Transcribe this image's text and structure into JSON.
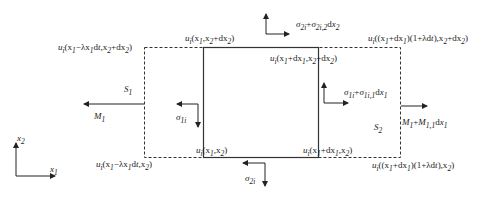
{
  "diagram": {
    "labels": {
      "top_left_dashed": "u_i(x_1−λx_1dt, x_2+dx_2)",
      "top_left_solid": "u_i(x_1, x_2+dx_2)",
      "top_right_solid": "u_i(x_1+dx_1, x_2+dx_2)",
      "top_right_dashed": "u_i((x_1+dx_1)(1+λdt), x_2+dx_2)",
      "bottom_left_dashed": "u_i(x_1−λx_1dt, x_2)",
      "bottom_left_solid": "u_i(x_1, x_2)",
      "bottom_right_solid": "u_i(x_1+dx_1, x_2)",
      "bottom_right_dashed": "u_i((x_1+dx_1)(1+λdt), x_2)",
      "sigma_top": "σ2i+σ2i,2dx2",
      "sigma_right": "σ1i+σ1i,1dx1",
      "sigma_left": "σ1i",
      "sigma_bottom": "σ2i",
      "S1": "S1",
      "S2": "S2",
      "M1": "M1",
      "M1_right": "M1+M1,1dx1",
      "axis_x1": "x1",
      "axis_x2": "x2"
    },
    "rendered": {
      "top_left_dashed": [
        "u",
        "i",
        "(x",
        "1",
        "−λx",
        "1",
        "d",
        "t",
        ",x",
        "2",
        "+dx",
        "2",
        ")"
      ],
      "top_left_solid": [
        "u",
        "i",
        "(x",
        "1",
        ",x",
        "2",
        "+dx",
        "2",
        ")"
      ],
      "top_right_solid": [
        "u",
        "i",
        "(x",
        "1",
        "+dx",
        "1",
        ",x",
        "2",
        "+dx",
        "2",
        ")"
      ],
      "top_right_dashed": [
        "u",
        "i",
        "((x",
        "1",
        "+dx",
        "1",
        ")(1+λd",
        "t",
        "),x",
        "2",
        "+dx",
        "2",
        ")"
      ],
      "bottom_left_dashed": [
        "u",
        "i",
        "(x",
        "1",
        "−λx",
        "1",
        "d",
        "t",
        ",x",
        "2",
        ")"
      ],
      "bottom_left_solid": [
        "u",
        "i",
        "(x",
        "1",
        ",x",
        "2",
        ")"
      ],
      "bottom_right_solid": [
        "u",
        "i",
        "(x",
        "1",
        "+dx",
        "1",
        ",x",
        "2",
        ")"
      ],
      "bottom_right_dashed": [
        "u",
        "i",
        "((x",
        "1",
        "+dx",
        "1",
        ")(1+λd",
        "t",
        "),x",
        "2",
        ")"
      ]
    }
  }
}
